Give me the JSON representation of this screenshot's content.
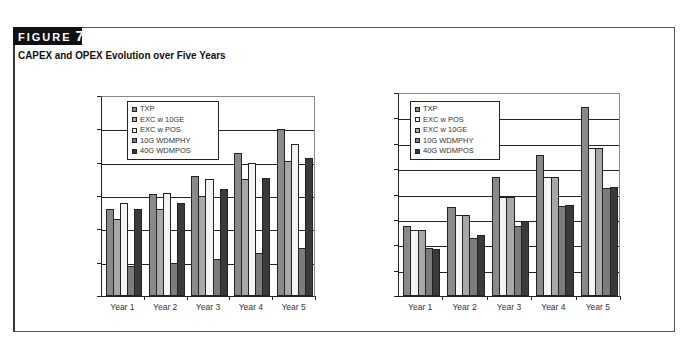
{
  "figure": {
    "label": "FIGURE",
    "number": "7",
    "title": "CAPEX and OPEX Evolution over Five Years"
  },
  "colors": {
    "TXP": "#8a8a8a",
    "EXC w 10GE": "#a8a8a8",
    "EXC w POS": "#f4f4f4",
    "10G WDMPHY": "#7c7c7c",
    "40G WDMPOS": "#3a3a3a"
  },
  "chart_data": [
    {
      "type": "bar",
      "title": "",
      "xlabel": "",
      "ylabel": "",
      "categories": [
        "Year 1",
        "Year 2",
        "Year 3",
        "Year 4",
        "Year 5"
      ],
      "ylim": [
        0,
        60000
      ],
      "yticks": [
        0,
        10000,
        20000,
        30000,
        40000,
        50000,
        60000
      ],
      "ytick_labels": [
        "$0",
        "$10,000",
        "$20,000",
        "$30,000",
        "$40,000",
        "$50,000",
        "$60,000"
      ],
      "grid": true,
      "legend_position": "upper-left-inside",
      "legend": [
        "TXP",
        "EXC w 10GE",
        "EXC w POS",
        "10G WDMPHY",
        "40G WDMPOS"
      ],
      "series": [
        {
          "name": "TXP",
          "values": [
            26000,
            30500,
            36000,
            43000,
            50000
          ]
        },
        {
          "name": "EXC w 10GE",
          "values": [
            23000,
            26000,
            30000,
            35000,
            40500
          ]
        },
        {
          "name": "EXC w POS",
          "values": [
            28000,
            31000,
            35000,
            40000,
            45500
          ]
        },
        {
          "name": "10G WDMPHY",
          "values": [
            9000,
            10000,
            11000,
            13000,
            14500
          ]
        },
        {
          "name": "40G WDMPOS",
          "values": [
            26000,
            28000,
            32000,
            35500,
            41500
          ]
        }
      ]
    },
    {
      "type": "bar",
      "title": "",
      "xlabel": "",
      "ylabel": "",
      "categories": [
        "Year 1",
        "Year 2",
        "Year 3",
        "Year 4",
        "Year 5"
      ],
      "ylim": [
        0,
        16000000
      ],
      "yticks": [
        0,
        2000000,
        4000000,
        6000000,
        8000000,
        10000000,
        12000000,
        14000000,
        16000000
      ],
      "ytick_labels": [
        "0",
        "2,000,000",
        "4,000,000",
        "6,000,000",
        "8,000,000",
        "10,000,000",
        "12,000,000",
        "14,000,000",
        "16,000,000"
      ],
      "grid": true,
      "legend_position": "upper-left-inside",
      "legend": [
        "TXP",
        "EXC w POS",
        "EXC w 10GE",
        "10G WDMPHY",
        "40G WDMPOS"
      ],
      "series": [
        {
          "name": "TXP",
          "values": [
            5500000,
            7000000,
            9400000,
            11100000,
            14900000
          ]
        },
        {
          "name": "EXC w POS",
          "values": [
            5200000,
            6400000,
            7800000,
            9400000,
            11700000
          ]
        },
        {
          "name": "EXC w 10GE",
          "values": [
            5200000,
            6400000,
            7800000,
            9400000,
            11700000
          ]
        },
        {
          "name": "10G WDMPHY",
          "values": [
            3800000,
            4600000,
            5500000,
            7100000,
            8500000
          ]
        },
        {
          "name": "40G WDMPOS",
          "values": [
            3700000,
            4800000,
            5900000,
            7200000,
            8600000
          ]
        }
      ]
    }
  ],
  "layout": [
    {
      "left": 101,
      "top": 96,
      "width": 214,
      "height": 201,
      "legend_left": 127,
      "legend_top": 101,
      "legend_width": 92,
      "ylabel_right": 97
    },
    {
      "left": 398,
      "top": 93,
      "width": 222,
      "height": 204,
      "legend_left": 410,
      "legend_top": 101,
      "legend_width": 90,
      "ylabel_right": 394
    }
  ]
}
